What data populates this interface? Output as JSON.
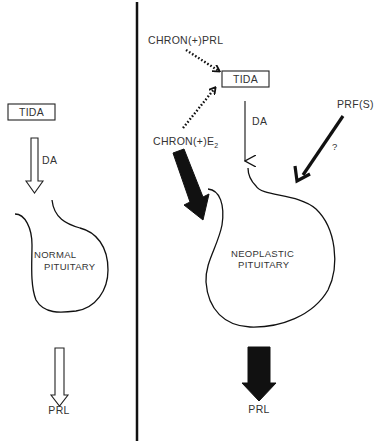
{
  "diagram": {
    "left_panel": {
      "source_box": "TIDA",
      "arrow_label": "DA",
      "gland_label_line1": "NORMAL",
      "gland_label_line2": "PITUITARY",
      "output_label": "PRL"
    },
    "right_panel": {
      "input_prl": "CHRON(+)PRL",
      "source_box": "TIDA",
      "arrow_label": "DA",
      "input_estrogen": "CHRON(+)E",
      "input_estrogen_sub": "2",
      "input_prf": "PRF(S)",
      "prf_question": "?",
      "gland_label_line1": "NEOPLASTIC",
      "gland_label_line2": "PITUITARY",
      "output_label": "PRL"
    },
    "colors": {
      "ink": "#111111",
      "text": "#333333",
      "background": "#ffffff"
    }
  }
}
